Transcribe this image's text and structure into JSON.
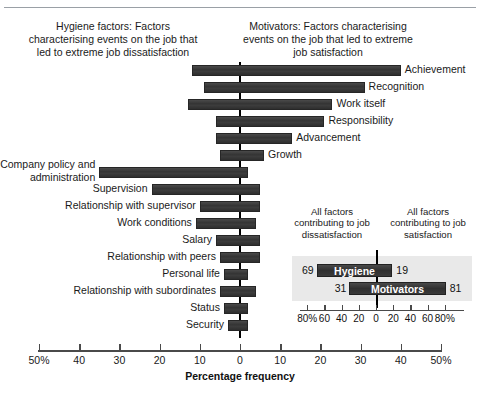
{
  "chart_data": {
    "type": "bar",
    "title": "",
    "orientation": "horizontal-diverging",
    "xlabel": "Percentage frequency",
    "ylabel": "",
    "xlim": [
      -50,
      50
    ],
    "xticks": [
      -50,
      -40,
      -30,
      -20,
      -10,
      0,
      10,
      20,
      30,
      40,
      50
    ],
    "xtick_labels": [
      "50%",
      "40",
      "30",
      "20",
      "10",
      "0",
      "10",
      "20",
      "30",
      "40",
      "50%"
    ],
    "grid": false,
    "legend": "none",
    "annotations": {
      "left_header": "Hygiene factors: Factors characterising events on the job that led to extreme job dissatisfaction",
      "right_header": "Motivators: Factors characterising events on the job that led to extreme job satisfaction"
    },
    "categories": [
      "Achievement",
      "Recognition",
      "Work itself",
      "Responsibility",
      "Advancement",
      "Growth",
      "Company policy and administration",
      "Supervision",
      "Relationship with supervisor",
      "Work conditions",
      "Salary",
      "Relationship with peers",
      "Personal life",
      "Relationship with subordinates",
      "Status",
      "Security"
    ],
    "series": [
      {
        "name": "Dissatisfaction (left of zero)",
        "values": [
          12,
          9,
          13,
          6,
          6,
          5,
          35,
          22,
          10,
          11,
          6,
          5,
          4,
          5,
          4,
          3
        ]
      },
      {
        "name": "Satisfaction (right of zero)",
        "values": [
          40,
          31,
          23,
          21,
          13,
          6,
          2,
          5,
          5,
          4,
          5,
          5,
          2,
          4,
          2,
          2
        ]
      }
    ]
  },
  "header": {
    "left_caption": "Hygiene factors: Factors characterising events on the job that led to extreme job dissatisfaction",
    "right_caption": "Motivators: Factors characterising events on the job that led to extreme job satisfaction"
  },
  "bars": [
    {
      "label": "Achievement",
      "side": "right",
      "neg": 12,
      "pos": 40
    },
    {
      "label": "Recognition",
      "side": "right",
      "neg": 9,
      "pos": 31
    },
    {
      "label": "Work itself",
      "side": "right",
      "neg": 13,
      "pos": 23
    },
    {
      "label": "Responsibility",
      "side": "right",
      "neg": 6,
      "pos": 21
    },
    {
      "label": "Advancement",
      "side": "right",
      "neg": 6,
      "pos": 13
    },
    {
      "label": "Growth",
      "side": "right",
      "neg": 5,
      "pos": 6
    },
    {
      "label": "Company policy and administration",
      "side": "left",
      "neg": 35,
      "pos": 2,
      "wrap": true
    },
    {
      "label": "Supervision",
      "side": "left",
      "neg": 22,
      "pos": 5
    },
    {
      "label": "Relationship with supervisor",
      "side": "left",
      "neg": 10,
      "pos": 5
    },
    {
      "label": "Work conditions",
      "side": "left",
      "neg": 11,
      "pos": 4
    },
    {
      "label": "Salary",
      "side": "left",
      "neg": 6,
      "pos": 5
    },
    {
      "label": "Relationship with peers",
      "side": "left",
      "neg": 5,
      "pos": 5
    },
    {
      "label": "Personal life",
      "side": "left",
      "neg": 4,
      "pos": 2
    },
    {
      "label": "Relationship with subordinates",
      "side": "left",
      "neg": 5,
      "pos": 4
    },
    {
      "label": "Status",
      "side": "left",
      "neg": 4,
      "pos": 2
    },
    {
      "label": "Security",
      "side": "left",
      "neg": 3,
      "pos": 2
    }
  ],
  "axis": {
    "title": "Percentage frequency",
    "tick_labels": [
      "50%",
      "40",
      "30",
      "20",
      "10",
      "0",
      "10",
      "20",
      "30",
      "40",
      "50%"
    ],
    "tick_values": [
      -50,
      -40,
      -30,
      -20,
      -10,
      0,
      10,
      20,
      30,
      40,
      50
    ]
  },
  "inset": {
    "caption_left": "All factors contributing to job dissatisfaction",
    "caption_right": "All factors contributing to job satisfaction",
    "rows": [
      {
        "name": "Hygiene",
        "left": 69,
        "right": 19
      },
      {
        "name": "Motivators",
        "left": 31,
        "right": 81
      }
    ],
    "axis_tick_labels": [
      "80%",
      "60",
      "40",
      "20",
      "0",
      "20",
      "40",
      "60",
      "80%"
    ],
    "axis_tick_values": [
      -80,
      -60,
      -40,
      -20,
      0,
      20,
      40,
      60,
      80
    ]
  },
  "colors": {
    "bar": "#3c3c3c",
    "axis": "#4a4a4a",
    "zero_line": "#000000",
    "inset_panel": "#e9e9e9",
    "text": "#1a1a1a"
  }
}
